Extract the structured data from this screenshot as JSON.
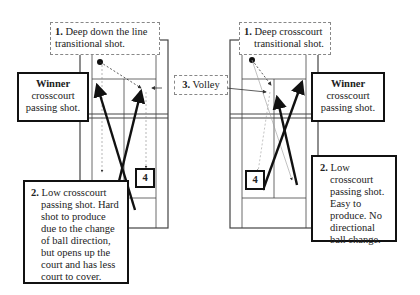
{
  "diagrams": [
    {
      "name": "left",
      "label1": {
        "num": "1.",
        "text": "Deep down the line transitional shot."
      },
      "winner": {
        "title": "Winner",
        "text": "crosscourt passing shot."
      },
      "label2": {
        "num": "2.",
        "text": "Low crosscourt passing shot. Hard shot to produce due to the change of ball direction, but opens up the court and has less court to cover."
      },
      "label4": "4"
    },
    {
      "name": "right",
      "label1": {
        "num": "1.",
        "text": "Deep crosscourt transitional shot."
      },
      "winner": {
        "title": "Winner",
        "text": "crosscourt passing shot."
      },
      "label2": {
        "num": "2.",
        "text": "Low crosscourt passing shot. Easy to produce. No directional ball change."
      },
      "label4": "4"
    }
  ],
  "volley": {
    "num": "3.",
    "text": "Volley"
  }
}
